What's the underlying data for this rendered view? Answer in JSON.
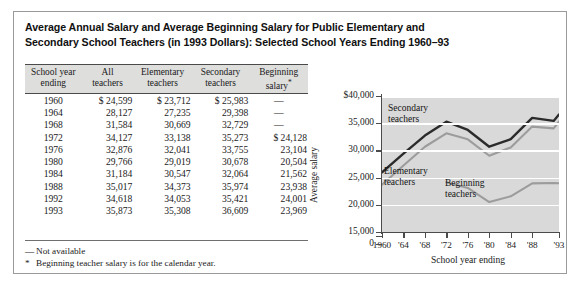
{
  "figure": {
    "title_line1": "Average Annual Salary and Average Beginning Salary for Public Elementary and",
    "title_line2": "Secondary School Teachers (in 1993 Dollars): Selected School Years Ending 1960–93"
  },
  "table": {
    "headers": [
      {
        "line1": "School year",
        "line2": "ending"
      },
      {
        "line1": "All",
        "line2": "teachers"
      },
      {
        "line1": "Elementary",
        "line2": "teachers"
      },
      {
        "line1": "Secondary",
        "line2": "teachers"
      },
      {
        "line1": "Beginning",
        "line2": "salary",
        "sup": "*"
      }
    ],
    "rows": [
      {
        "year": "1960",
        "all": "$ 24,599",
        "elementary": "$ 23,712",
        "secondary": "$ 25,983",
        "beginning": "—"
      },
      {
        "year": "1964",
        "all": "28,127",
        "elementary": "27,235",
        "secondary": "29,398",
        "beginning": "—"
      },
      {
        "year": "1968",
        "all": "31,584",
        "elementary": "30,669",
        "secondary": "32,729",
        "beginning": "—"
      },
      {
        "year": "1972",
        "all": "34,127",
        "elementary": "33,138",
        "secondary": "35,273",
        "beginning": "$ 24,128"
      },
      {
        "year": "1976",
        "all": "32,876",
        "elementary": "32,041",
        "secondary": "33,755",
        "beginning": "23,104"
      },
      {
        "year": "1980",
        "all": "29,766",
        "elementary": "29,019",
        "secondary": "30,678",
        "beginning": "20,504"
      },
      {
        "year": "1984",
        "all": "31,184",
        "elementary": "30,547",
        "secondary": "32,064",
        "beginning": "21,562"
      },
      {
        "year": "1988",
        "all": "35,017",
        "elementary": "34,373",
        "secondary": "35,974",
        "beginning": "23,938"
      },
      {
        "year": "1992",
        "all": "34,618",
        "elementary": "34,053",
        "secondary": "35,421",
        "beginning": "24,001"
      },
      {
        "year": "1993",
        "all": "35,873",
        "elementary": "35,308",
        "secondary": "36,609",
        "beginning": "23,969"
      }
    ]
  },
  "notes": [
    {
      "marker": "—",
      "text": "Not available"
    },
    {
      "marker": "*",
      "text": "Beginning teacher salary is for the calendar year."
    }
  ],
  "chart_data": {
    "type": "line",
    "title": "",
    "xlabel": "School year ending",
    "ylabel": "Average salary",
    "x": [
      1960,
      1964,
      1968,
      1972,
      1976,
      1980,
      1984,
      1988,
      1992,
      1993
    ],
    "xtick_labels": [
      "1960",
      "'64",
      "'68",
      "'72",
      "'76",
      "'80",
      "'84",
      "'88",
      "'93"
    ],
    "xtick_values": [
      1960,
      1964,
      1968,
      1972,
      1976,
      1980,
      1984,
      1988,
      1993
    ],
    "ytick_labels": [
      "$40,000",
      "35,000",
      "30,000",
      "25,000",
      "20,000",
      "15,000",
      "0"
    ],
    "ytick_values": [
      40000,
      35000,
      30000,
      25000,
      20000,
      15000,
      0
    ],
    "ylim": [
      15000,
      40000
    ],
    "axis_break": true,
    "grid": "horizontal-white",
    "plot_background": "#d9d9d9",
    "legend": "inline-annotations",
    "series": [
      {
        "name": "Secondary teachers",
        "color": "#2b2b2b",
        "values": [
          25983,
          29398,
          32729,
          35273,
          33755,
          30678,
          32064,
          35974,
          35421,
          36609
        ]
      },
      {
        "name": "Elementary teachers",
        "color": "#9c9c9c",
        "values": [
          23712,
          27235,
          30669,
          33138,
          32041,
          29019,
          30547,
          34373,
          34053,
          35308
        ]
      },
      {
        "name": "Beginning teachers",
        "color": "#9c9c9c",
        "values": [
          null,
          null,
          null,
          24128,
          23104,
          20504,
          21562,
          23938,
          24001,
          23969
        ]
      }
    ]
  }
}
